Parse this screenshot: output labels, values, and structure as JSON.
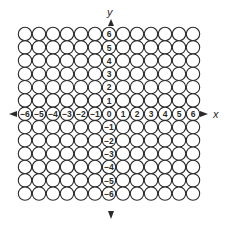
{
  "diagram": {
    "type": "coordinate-grid-of-circles",
    "x_axis_label": "x",
    "y_axis_label": "y",
    "x_range": [
      -6,
      6
    ],
    "y_range": [
      -6,
      6
    ],
    "x_ticks": [
      "−6",
      "−5",
      "−4",
      "−3",
      "−2",
      "−1",
      "0",
      "1",
      "2",
      "3",
      "4",
      "5",
      "6"
    ],
    "y_ticks_positive": [
      "6",
      "5",
      "4",
      "3",
      "2",
      "1"
    ],
    "y_ticks_negative": [
      "−1",
      "−2",
      "−3",
      "−4",
      "−5",
      "−6"
    ],
    "origin_label": "0",
    "grid_rows": 13,
    "grid_cols": 13,
    "colors": {
      "stroke": "#2a2a2a",
      "fill": "#ffffff",
      "background": "#ffffff"
    }
  }
}
